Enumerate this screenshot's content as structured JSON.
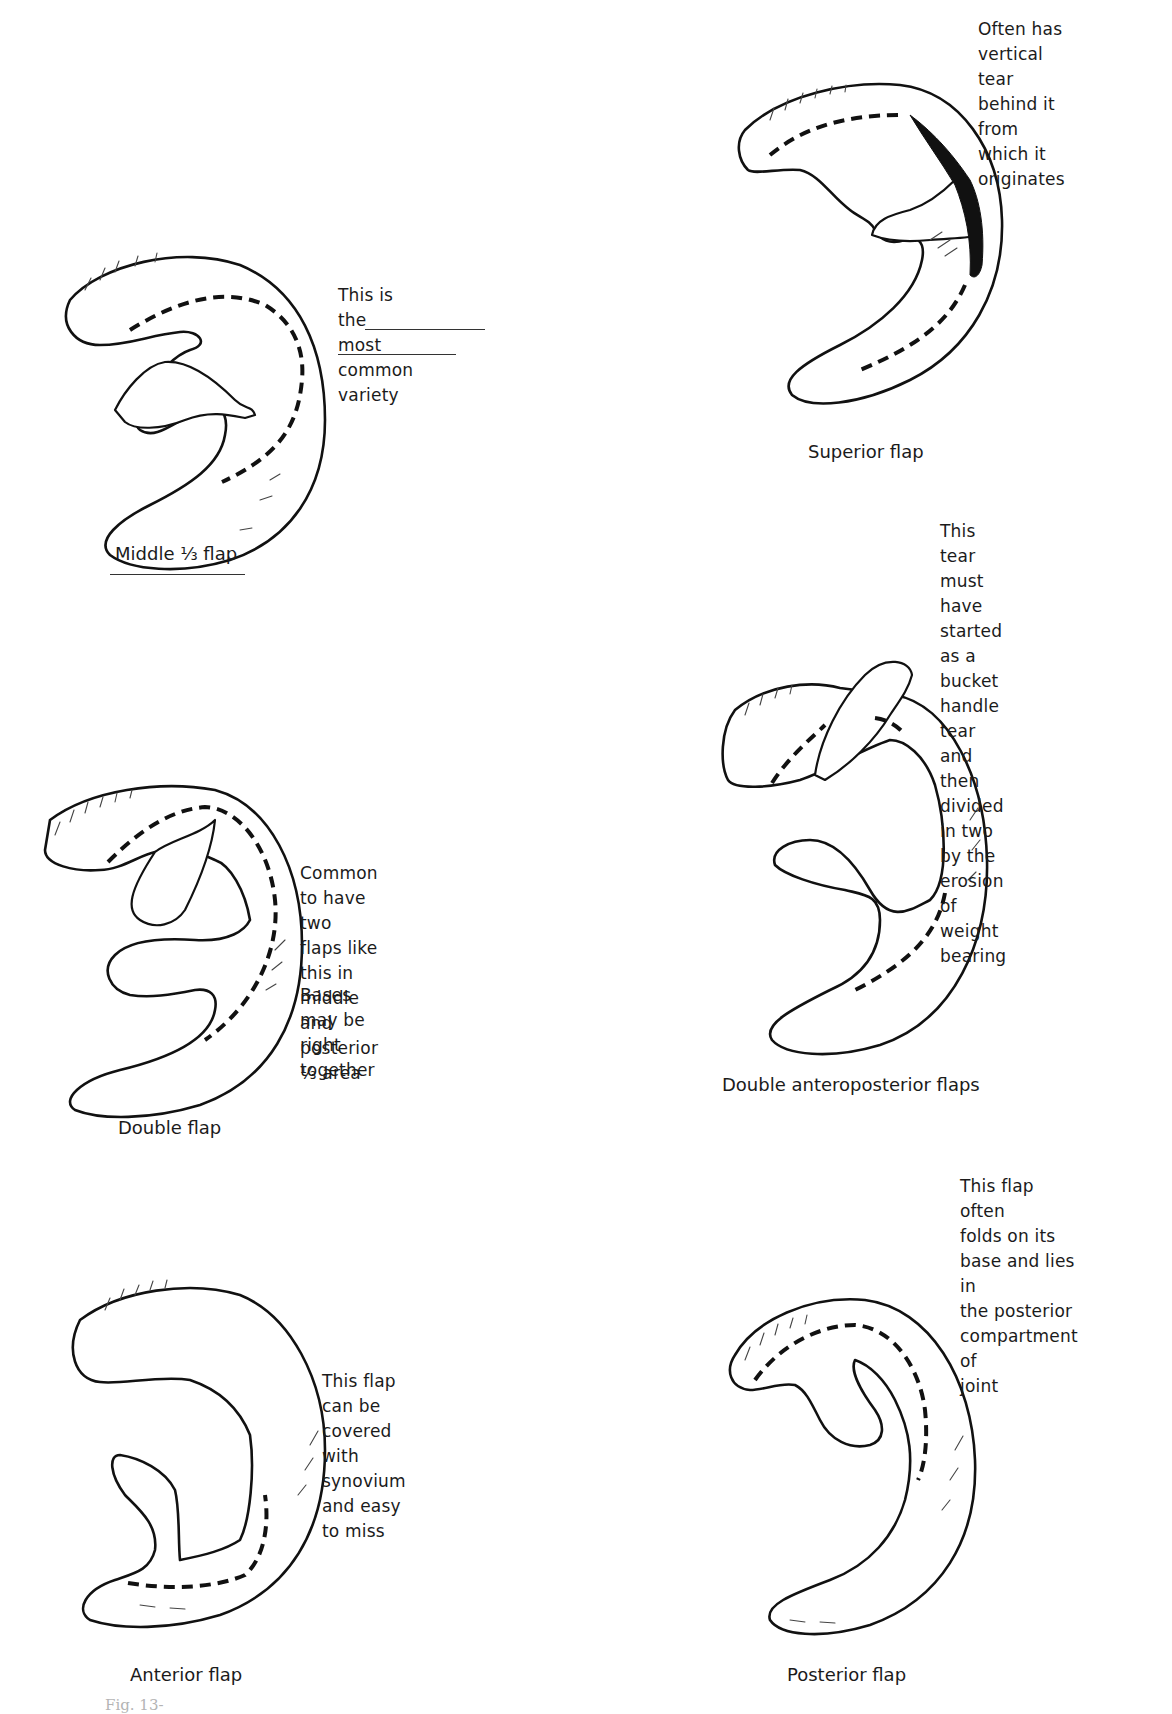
{
  "figure": {
    "number_fragment": "Fig. 13-",
    "panels": [
      {
        "id": "middle-third",
        "caption": "Middle ⅓ flap",
        "note": "This is the most\ncommon variety"
      },
      {
        "id": "superior",
        "caption": "Superior flap",
        "note": "Often has vertical\ntear behind it\nfrom which it\noriginates"
      },
      {
        "id": "double",
        "caption": "Double flap",
        "note": "Common to have\ntwo flaps like\nthis in middle and\nposterior ⅓ area",
        "note2": "Bases may be\nright together"
      },
      {
        "id": "double-anteroposterior",
        "caption": "Double anteroposterior flaps",
        "note": "This tear must\nhave started as a\nbucket handle tear\nand then divided\nin two by the\nerosion of weight\nbearing"
      },
      {
        "id": "anterior",
        "caption": "Anterior flap",
        "note": "This flap can be\ncovered with\nsynovium and easy\nto miss"
      },
      {
        "id": "posterior",
        "caption": "Posterior flap",
        "note": "This flap often\nfolds on its\nbase and lies in\nthe posterior\ncompartment of\njoint"
      }
    ]
  },
  "colors": {
    "ink": "#111111",
    "paper": "#ffffff"
  }
}
